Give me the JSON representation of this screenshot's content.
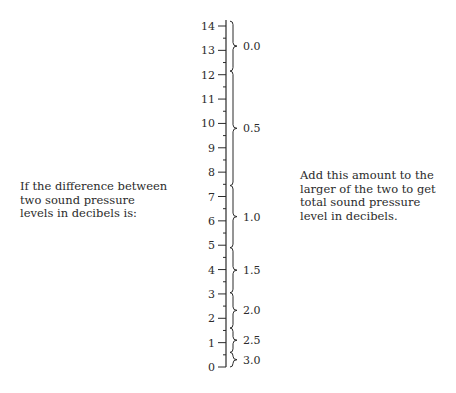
{
  "left_text": "If the difference between two sound pressure levels in decibels is:",
  "right_text": "Add this amount to the larger of the two to get total sound pressure level in decibels.",
  "caption": "",
  "scale": {
    "min": 0,
    "max": 14,
    "major_ticks": [
      0,
      1,
      2,
      3,
      4,
      5,
      6,
      7,
      8,
      9,
      10,
      11,
      12,
      13,
      14
    ],
    "minor_step": 0.5
  },
  "braces": [
    {
      "label": "0.0",
      "from": 12.15,
      "to": 14.2
    },
    {
      "label": "0.5",
      "from": 7.45,
      "to": 12.15
    },
    {
      "label": "1.0",
      "from": 4.9,
      "to": 7.45
    },
    {
      "label": "1.5",
      "from": 3.05,
      "to": 4.9
    },
    {
      "label": "2.0",
      "from": 1.6,
      "to": 3.05
    },
    {
      "label": "2.5",
      "from": 0.6,
      "to": 1.6
    },
    {
      "label": "3.0",
      "from": 0.0,
      "to": 0.6
    }
  ],
  "colors": {
    "ink": "#2b2b2b",
    "background": "#ffffff"
  }
}
